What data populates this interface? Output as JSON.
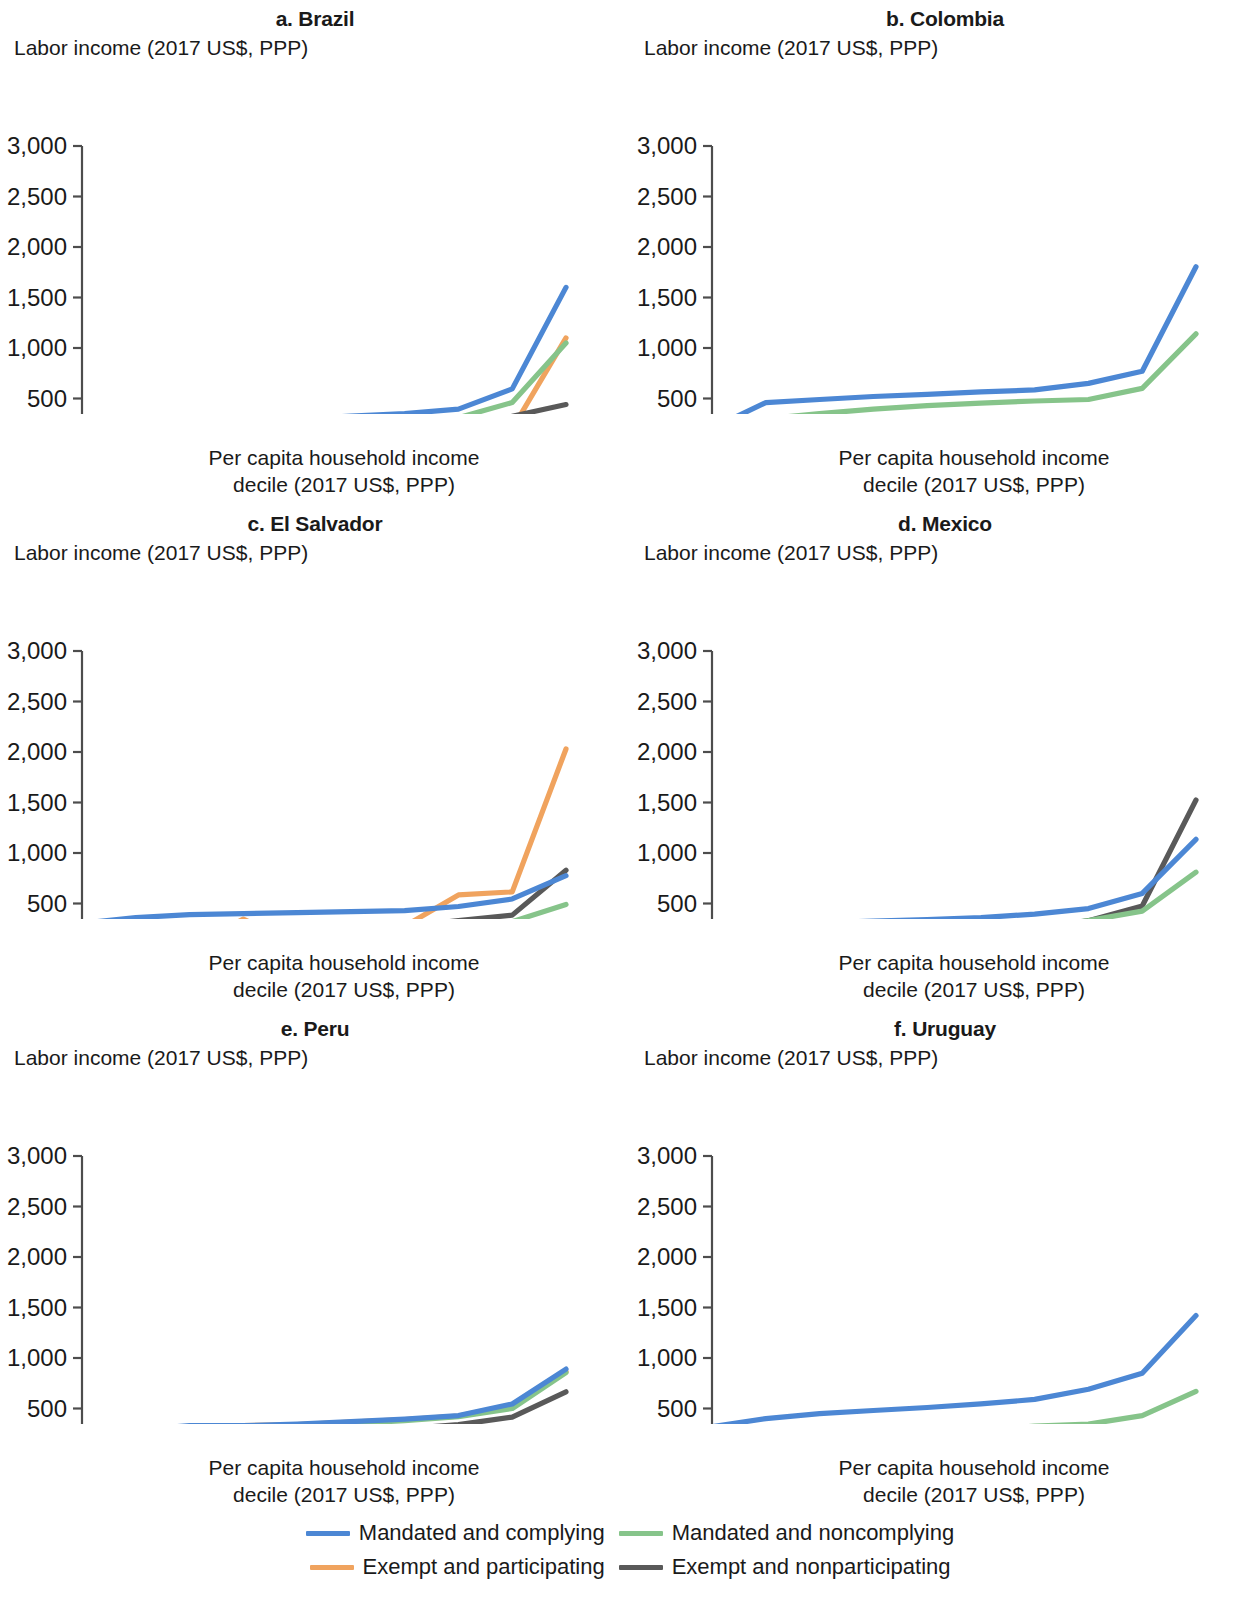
{
  "figure": {
    "y_axis_title": "Labor income (2017 US$, PPP)",
    "x_axis_title_line1": "Per capita household income",
    "x_axis_title_line2": "decile (2017 US$, PPP)"
  },
  "legend": {
    "items": [
      {
        "label": "Mandated and complying",
        "color": "#4C87D4",
        "key": "mandated_complying"
      },
      {
        "label": "Mandated and noncomplying",
        "color": "#86C48A",
        "key": "mandated_noncomplying"
      },
      {
        "label": "Exempt and participating",
        "color": "#F0A35E",
        "key": "exempt_participating"
      },
      {
        "label": "Exempt and nonparticipating",
        "color": "#595959",
        "key": "exempt_nonparticipating"
      }
    ]
  },
  "axes": {
    "y_ticks": [
      "0",
      "500",
      "1,000",
      "1,500",
      "2,000",
      "2,500",
      "3,000"
    ],
    "y_tick_values": [
      0,
      500,
      1000,
      1500,
      2000,
      2500,
      3000
    ],
    "ylim": [
      0,
      3000
    ],
    "x_ticks": [
      "1",
      "2",
      "3",
      "4",
      "5",
      "6",
      "7",
      "8",
      "9",
      "10"
    ],
    "xlim": [
      1,
      10
    ],
    "grid": false
  },
  "chart_data": [
    {
      "type": "line",
      "panel": "a",
      "title": "a. Brazil",
      "xlabel": "Per capita household income decile (2017 US$, PPP)",
      "ylabel": "Labor income (2017 US$, PPP)",
      "ylim": [
        0,
        3000
      ],
      "x": [
        1,
        2,
        3,
        4,
        5,
        6,
        7,
        8,
        9,
        10
      ],
      "categories": [
        "1",
        "2",
        "3",
        "4",
        "5",
        "6",
        "7",
        "8",
        "9",
        "10"
      ],
      "series": [
        {
          "name": "Mandated and complying",
          "color": "#4C87D4",
          "x": [
            1,
            2,
            3,
            4,
            5,
            6,
            7,
            8,
            9,
            10
          ],
          "values": [
            175,
            235,
            265,
            285,
            300,
            325,
            350,
            395,
            595,
            1600
          ]
        },
        {
          "name": "Mandated and noncomplying",
          "color": "#86C48A",
          "x": [
            1,
            2,
            3,
            4,
            5,
            6,
            7,
            8,
            9,
            10
          ],
          "values": [
            95,
            165,
            195,
            215,
            235,
            255,
            275,
            310,
            460,
            1050
          ]
        },
        {
          "name": "Exempt and participating",
          "color": "#F0A35E",
          "x": [
            8,
            9,
            10
          ],
          "values": [
            300,
            200,
            1100
          ]
        },
        {
          "name": "Exempt and nonparticipating",
          "color": "#595959",
          "x": [
            1,
            2,
            3,
            4,
            5,
            6,
            7,
            8,
            9,
            10
          ],
          "values": [
            15,
            15,
            15,
            85,
            55,
            65,
            175,
            30,
            325,
            440
          ]
        }
      ]
    },
    {
      "type": "line",
      "panel": "b",
      "title": "b. Colombia",
      "xlabel": "Per capita household income decile (2017 US$, PPP)",
      "ylabel": "Labor income (2017 US$, PPP)",
      "ylim": [
        0,
        3000
      ],
      "x": [
        1,
        2,
        3,
        4,
        5,
        6,
        7,
        8,
        9,
        10
      ],
      "categories": [
        "1",
        "2",
        "3",
        "4",
        "5",
        "6",
        "7",
        "8",
        "9",
        "10"
      ],
      "series": [
        {
          "name": "Mandated and complying",
          "color": "#4C87D4",
          "x": [
            1,
            2,
            3,
            4,
            5,
            6,
            7,
            8,
            9,
            10
          ],
          "values": [
            205,
            460,
            490,
            520,
            540,
            565,
            585,
            650,
            770,
            1805
          ]
        },
        {
          "name": "Mandated and noncomplying",
          "color": "#86C48A",
          "x": [
            1,
            2,
            3,
            4,
            5,
            6,
            7,
            8,
            9,
            10
          ],
          "values": [
            180,
            300,
            350,
            395,
            430,
            455,
            475,
            490,
            600,
            1140
          ]
        },
        {
          "name": "Exempt and participating",
          "color": "#F0A35E",
          "x": [
            1,
            2,
            3,
            4,
            5,
            6,
            7,
            8,
            9,
            10
          ],
          "values": [
            155,
            240,
            250,
            240,
            235,
            235,
            240,
            240,
            240,
            235
          ]
        },
        {
          "name": "Exempt and nonparticipating",
          "color": "#595959",
          "x": [
            1,
            2,
            3,
            4,
            5,
            6,
            7,
            8,
            9,
            10
          ],
          "values": [
            140,
            200,
            215,
            215,
            220,
            225,
            230,
            235,
            235,
            225
          ]
        }
      ]
    },
    {
      "type": "line",
      "panel": "c",
      "title": "c. El Salvador",
      "xlabel": "Per capita household income decile (2017 US$, PPP)",
      "ylabel": "Labor income (2017 US$, PPP)",
      "ylim": [
        0,
        3000
      ],
      "x": [
        1,
        2,
        3,
        4,
        5,
        6,
        7,
        8,
        9,
        10
      ],
      "categories": [
        "1",
        "2",
        "3",
        "4",
        "5",
        "6",
        "7",
        "8",
        "9",
        "10"
      ],
      "series": [
        {
          "name": "Mandated and complying",
          "color": "#4C87D4",
          "x": [
            1,
            2,
            3,
            4,
            5,
            6,
            7,
            8,
            9,
            10
          ],
          "values": [
            305,
            360,
            390,
            400,
            410,
            420,
            430,
            470,
            545,
            775
          ]
        },
        {
          "name": "Mandated and noncomplying",
          "color": "#86C48A",
          "x": [
            1,
            2,
            3,
            4,
            5,
            6,
            7,
            8,
            9,
            10
          ],
          "values": [
            170,
            215,
            240,
            250,
            255,
            265,
            280,
            300,
            320,
            490
          ]
        },
        {
          "name": "Exempt and participating",
          "color": "#F0A35E",
          "x": [
            3,
            4,
            5,
            6,
            7,
            8,
            9,
            10
          ],
          "values": [
            75,
            345,
            100,
            180,
            275,
            585,
            615,
            2030
          ]
        },
        {
          "name": "Exempt and nonparticipating",
          "color": "#595959",
          "x": [
            1,
            2,
            3,
            4,
            5,
            6,
            7,
            8,
            9,
            10
          ],
          "values": [
            115,
            155,
            180,
            200,
            225,
            245,
            275,
            330,
            385,
            830
          ]
        }
      ]
    },
    {
      "type": "line",
      "panel": "d",
      "title": "d. Mexico",
      "xlabel": "Per capita household income decile (2017 US$, PPP)",
      "ylabel": "Labor income (2017 US$, PPP)",
      "ylim": [
        0,
        3000
      ],
      "x": [
        1,
        2,
        3,
        4,
        5,
        6,
        7,
        8,
        9,
        10
      ],
      "categories": [
        "1",
        "2",
        "3",
        "4",
        "5",
        "6",
        "7",
        "8",
        "9",
        "10"
      ],
      "series": [
        {
          "name": "Mandated and complying",
          "color": "#4C87D4",
          "x": [
            1,
            2,
            3,
            4,
            5,
            6,
            7,
            8,
            9,
            10
          ],
          "values": [
            190,
            275,
            310,
            325,
            340,
            360,
            395,
            450,
            600,
            1135
          ]
        },
        {
          "name": "Mandated and noncomplying",
          "color": "#86C48A",
          "x": [
            1,
            2,
            3,
            4,
            5,
            6,
            7,
            8,
            9,
            10
          ],
          "values": [
            130,
            185,
            195,
            205,
            215,
            230,
            265,
            330,
            425,
            810
          ]
        },
        {
          "name": "Exempt and nonparticipating",
          "color": "#595959",
          "x": [
            1,
            2,
            3,
            4,
            5,
            6,
            7,
            8,
            9,
            10
          ],
          "values": [
            55,
            115,
            140,
            160,
            170,
            195,
            250,
            330,
            475,
            1525
          ]
        }
      ]
    },
    {
      "type": "line",
      "panel": "e",
      "title": "e. Peru",
      "xlabel": "Per capita household income decile (2017 US$, PPP)",
      "ylabel": "Labor income (2017 US$, PPP)",
      "ylim": [
        0,
        3000
      ],
      "x": [
        1,
        2,
        3,
        4,
        5,
        6,
        7,
        8,
        9,
        10
      ],
      "categories": [
        "1",
        "2",
        "3",
        "4",
        "5",
        "6",
        "7",
        "8",
        "9",
        "10"
      ],
      "series": [
        {
          "name": "Mandated and complying",
          "color": "#4C87D4",
          "x": [
            1,
            2,
            3,
            4,
            5,
            6,
            7,
            8,
            9,
            10
          ],
          "values": [
            195,
            290,
            330,
            330,
            345,
            370,
            395,
            430,
            545,
            890
          ]
        },
        {
          "name": "Mandated and noncomplying",
          "color": "#86C48A",
          "x": [
            1,
            2,
            3,
            4,
            5,
            6,
            7,
            8,
            9,
            10
          ],
          "values": [
            130,
            235,
            275,
            300,
            320,
            350,
            380,
            420,
            500,
            855
          ]
        },
        {
          "name": "Exempt and participating",
          "color": "#F0A35E",
          "x": [
            1,
            2,
            3,
            4,
            5,
            6,
            7,
            8,
            9,
            10
          ],
          "values": [
            165,
            285,
            320,
            330,
            340,
            365,
            390,
            425,
            535,
            865
          ]
        },
        {
          "name": "Exempt and nonparticipating",
          "color": "#595959",
          "x": [
            1,
            2,
            3,
            4,
            5,
            6,
            7,
            8,
            9,
            10
          ],
          "values": [
            110,
            160,
            200,
            230,
            250,
            275,
            300,
            340,
            415,
            665
          ]
        }
      ]
    },
    {
      "type": "line",
      "panel": "f",
      "title": "f. Uruguay",
      "xlabel": "Per capita household income decile (2017 US$, PPP)",
      "ylabel": "Labor income (2017 US$, PPP)",
      "ylim": [
        0,
        3000
      ],
      "x": [
        1,
        2,
        3,
        4,
        5,
        6,
        7,
        8,
        9,
        10
      ],
      "categories": [
        "1",
        "2",
        "3",
        "4",
        "5",
        "6",
        "7",
        "8",
        "9",
        "10"
      ],
      "series": [
        {
          "name": "Mandated and complying",
          "color": "#4C87D4",
          "x": [
            1,
            2,
            3,
            4,
            5,
            6,
            7,
            8,
            9,
            10
          ],
          "values": [
            320,
            400,
            450,
            480,
            510,
            545,
            590,
            690,
            850,
            1420
          ]
        },
        {
          "name": "Mandated and noncomplying",
          "color": "#86C48A",
          "x": [
            1,
            2,
            3,
            4,
            5,
            6,
            7,
            8,
            9,
            10
          ],
          "values": [
            160,
            195,
            215,
            235,
            260,
            290,
            325,
            345,
            430,
            670
          ]
        }
      ]
    }
  ]
}
